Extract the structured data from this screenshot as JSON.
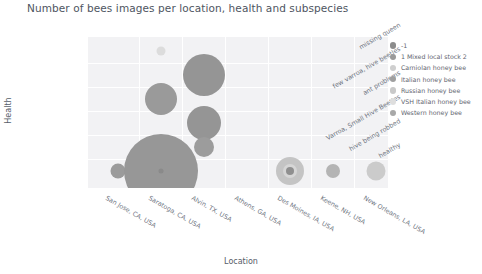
{
  "title": "Number of bees images per location, health and subspecies",
  "axes": {
    "xlabel": "Location",
    "ylabel": "Health"
  },
  "legend": {
    "items": [
      {
        "label": "-1",
        "color": "#8c8c8c"
      },
      {
        "label": "1 Mixed local stock 2",
        "color": "#9a9a9a"
      },
      {
        "label": "Carniolan honey bee",
        "color": "#cfcfcf"
      },
      {
        "label": "Italian honey bee",
        "color": "#9f9f9f"
      },
      {
        "label": "Russian honey bee",
        "color": "#c9c9c9"
      },
      {
        "label": "VSH Italian honey bee",
        "color": "#dedede"
      },
      {
        "label": "Western honey bee",
        "color": "#a8a8a8"
      }
    ]
  },
  "chart_data": {
    "type": "scatter",
    "title": "Number of bees images per location, health and subspecies",
    "xlabel": "Location",
    "ylabel": "Health",
    "grid": true,
    "legend_position": "right",
    "categories": [
      "San Jose, CA, USA",
      "Saratoga, CA, USA",
      "Alvin, TX, USA",
      "Athens, GA, USA",
      "Des Moines, IA, USA",
      "Keene, NH, USA",
      "New Orleans, LA, USA"
    ],
    "y_categories": [
      "missing queen",
      "few varroa, hive beetles",
      "ant problems",
      "Varroa, Small Hive Beetles",
      "hive being robbed",
      "healthy"
    ],
    "points": [
      {
        "x": "Saratoga, CA, USA",
        "y": "missing queen",
        "subspecies": "VSH Italian honey bee",
        "color": "#dcdcdc",
        "r": 4.5
      },
      {
        "x": "Alvin, TX, USA",
        "y": "few varroa, hive beetles",
        "subspecies": "Italian honey bee",
        "color": "#959595",
        "r": 21
      },
      {
        "x": "Saratoga, CA, USA",
        "y": "ant problems",
        "subspecies": "Italian honey bee",
        "color": "#9a9a9a",
        "r": 16
      },
      {
        "x": "Alvin, TX, USA",
        "y": "Varroa, Small Hive Beetles",
        "subspecies": "Italian honey bee",
        "color": "#959595",
        "r": 17
      },
      {
        "x": "San Jose, CA, USA",
        "y": "healthy",
        "subspecies": "Western honey bee",
        "color": "#9b9b9b",
        "r": 7.5
      },
      {
        "x": "Saratoga, CA, USA",
        "y": "healthy",
        "subspecies": "Italian honey bee",
        "color": "#979797",
        "r": 37
      },
      {
        "x": "Saratoga, CA, USA",
        "y": "healthy",
        "subspecies": "-1",
        "color": "#8a8a8a",
        "r": 2.5
      },
      {
        "x": "Alvin, TX, USA",
        "y": "hive being robbed",
        "subspecies": "Italian honey bee",
        "color": "#9c9c9c",
        "r": 10
      },
      {
        "x": "Des Moines, IA, USA",
        "y": "healthy",
        "subspecies": "Russian honey bee",
        "color": "#c4c4c4",
        "r": 14
      },
      {
        "x": "Des Moines, IA, USA",
        "y": "healthy",
        "subspecies": "Carniolan honey bee",
        "color": "#d6d6d6",
        "r": 7
      },
      {
        "x": "Des Moines, IA, USA",
        "y": "healthy",
        "subspecies": "-1",
        "color": "#8f8f8f",
        "r": 4
      },
      {
        "x": "Keene, NH, USA",
        "y": "healthy",
        "subspecies": "Western honey bee",
        "color": "#b4b4b4",
        "r": 7
      },
      {
        "x": "New Orleans, LA, USA",
        "y": "healthy",
        "subspecies": "Carniolan honey bee",
        "color": "#cbcbcb",
        "r": 9.5
      }
    ]
  },
  "layout": {
    "x_positions": [
      30,
      73,
      116,
      159,
      202,
      245,
      288
    ],
    "y_positions": [
      14,
      38,
      62,
      86,
      110,
      134
    ],
    "grid_v": [
      51,
      94,
      137,
      180,
      223,
      266
    ],
    "grid_h": [
      26,
      50,
      74,
      98,
      122
    ],
    "xtick_anchors": [
      {
        "left": 108,
        "top": 194
      },
      {
        "left": 151,
        "top": 194
      },
      {
        "left": 194,
        "top": 194
      },
      {
        "left": 237,
        "top": 194
      },
      {
        "left": 280,
        "top": 194
      },
      {
        "left": 323,
        "top": 194
      },
      {
        "left": 366,
        "top": 194
      }
    ],
    "ytick_anchors": [
      {
        "right": 398,
        "top": 21
      },
      {
        "right": 398,
        "top": 45
      },
      {
        "right": 398,
        "top": 69
      },
      {
        "right": 398,
        "top": 93
      },
      {
        "right": 398,
        "top": 117
      },
      {
        "right": 398,
        "top": 141
      }
    ]
  }
}
